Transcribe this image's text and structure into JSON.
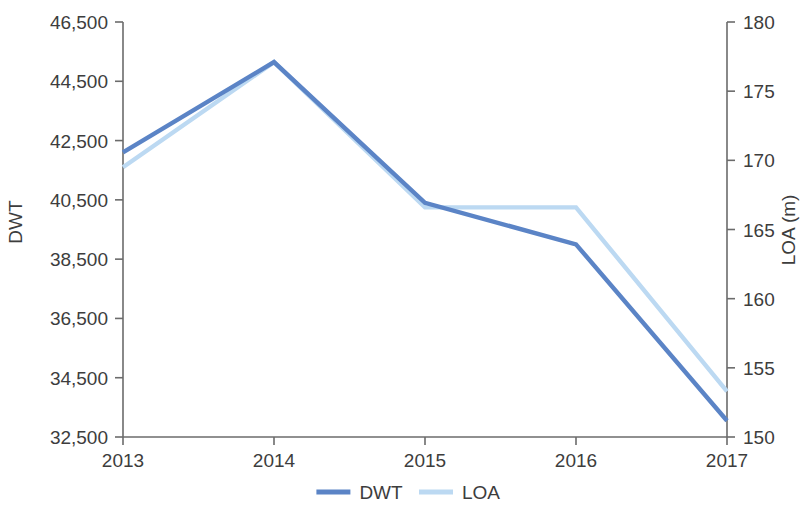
{
  "chart_data": {
    "type": "line",
    "title": "",
    "subtitle": "",
    "xlabel": "",
    "categories": [
      "2013",
      "2014",
      "2015",
      "2016",
      "2017"
    ],
    "x": [
      2013,
      2014,
      2015,
      2016,
      2017
    ],
    "grid": false,
    "legend_position": "bottom-center",
    "axes": {
      "left": {
        "label": "DWT",
        "ticks": [
          "32,500",
          "34,500",
          "36,500",
          "38,500",
          "40,500",
          "42,500",
          "44,500",
          "46,500"
        ],
        "tick_values": [
          32500,
          34500,
          36500,
          38500,
          40500,
          42500,
          44500,
          46500
        ],
        "ylim": [
          32500,
          46500
        ],
        "step": 2000
      },
      "right": {
        "label": "LOA (m)",
        "ticks": [
          "150",
          "155",
          "160",
          "165",
          "170",
          "175",
          "180"
        ],
        "tick_values": [
          150,
          155,
          160,
          165,
          170,
          175,
          180
        ],
        "ylim": [
          150,
          180
        ],
        "step": 5
      }
    },
    "series": [
      {
        "name": "DWT",
        "axis": "left",
        "color": "#5b84c6",
        "values": [
          42100,
          45150,
          40400,
          39000,
          33050
        ]
      },
      {
        "name": "LOA",
        "axis": "right",
        "color": "#bcd9f2",
        "values": [
          169.5,
          177.1,
          166.6,
          166.6,
          153.3
        ]
      }
    ]
  },
  "legend": {
    "items": [
      {
        "label": "DWT",
        "color": "#5b84c6"
      },
      {
        "label": "LOA",
        "color": "#bcd9f2"
      }
    ]
  }
}
